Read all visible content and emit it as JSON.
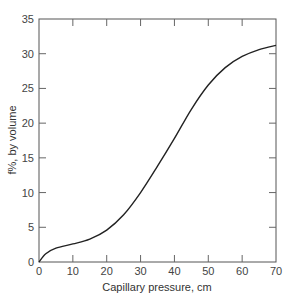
{
  "chart_data": {
    "type": "line",
    "title": "",
    "xlabel": "Capillary pressure, cm",
    "ylabel": "f%, by volume",
    "xlim": [
      0,
      70
    ],
    "ylim": [
      0,
      35
    ],
    "x_ticks": [
      "0",
      "10",
      "20",
      "30",
      "40",
      "50",
      "60",
      "70"
    ],
    "y_ticks": [
      "0",
      "5",
      "10",
      "15",
      "20",
      "25",
      "30",
      "35"
    ],
    "grid": false,
    "legend": null,
    "series": [
      {
        "name": "curve",
        "x": [
          0,
          2,
          5,
          10,
          15,
          20,
          25,
          30,
          35,
          40,
          45,
          50,
          55,
          60,
          65,
          70
        ],
        "values": [
          0,
          1.2,
          2.0,
          2.6,
          3.3,
          4.6,
          6.8,
          10.0,
          13.8,
          17.8,
          22.0,
          25.5,
          28.0,
          29.6,
          30.6,
          31.2
        ]
      }
    ]
  }
}
